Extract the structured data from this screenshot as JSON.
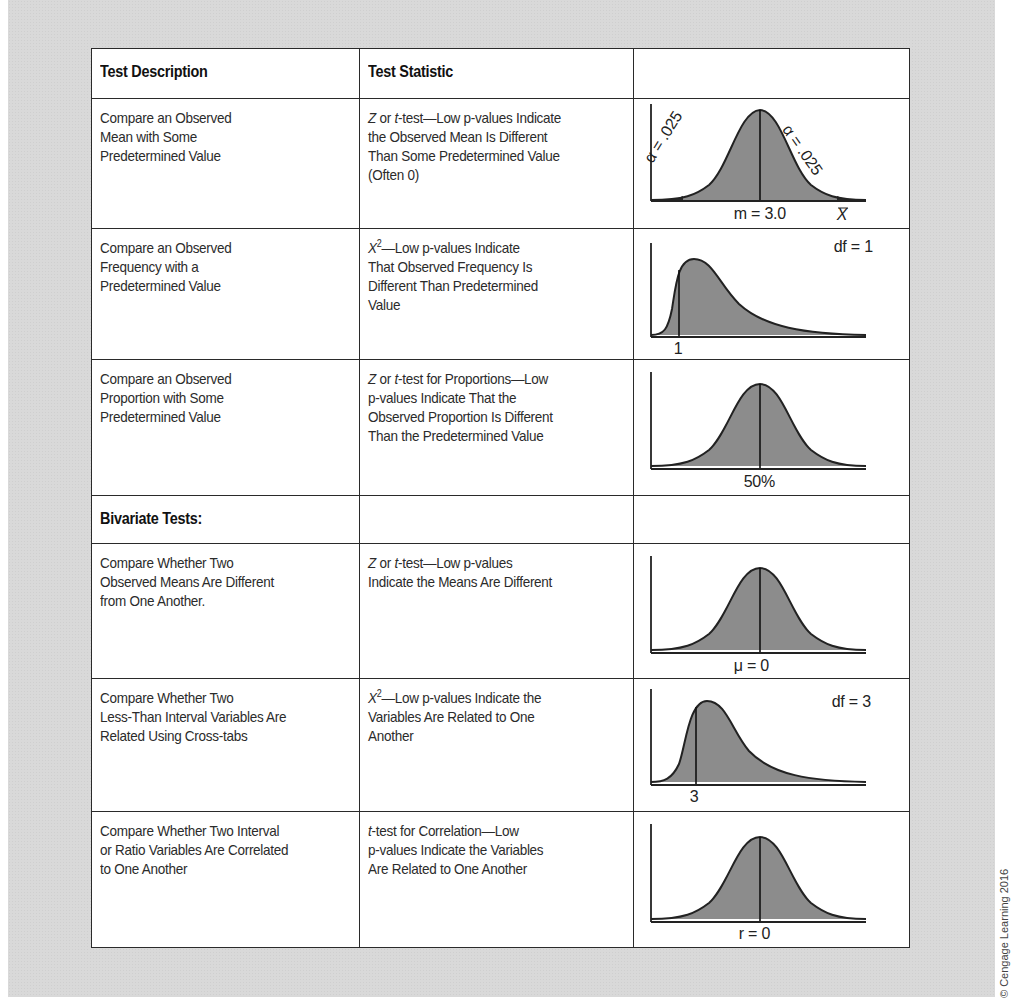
{
  "table": {
    "headers": [
      "Test Description",
      "Test Statistic",
      ""
    ],
    "rows": [
      {
        "description": [
          "Compare an Observed",
          "Mean with Some",
          "Predetermined Value"
        ],
        "statistic_prefix": "Z",
        "statistic": [
          "Z or t-test—Low p-values Indicate",
          "the Observed Mean Is Different",
          "Than Some Predetermined Value",
          "(Often 0)"
        ],
        "graph": {
          "type": "normal-two-tailed",
          "center_label": "m = 3.0",
          "axis_label": "X̄",
          "left_tail_label": "α = .025",
          "right_tail_label": "α = .025"
        }
      },
      {
        "description": [
          "Compare an Observed",
          "Frequency with a",
          "Predetermined Value"
        ],
        "statistic": [
          "X²—Low p-values Indicate",
          "That Observed Frequency Is",
          "Different Than Predetermined",
          "Value"
        ],
        "graph": {
          "type": "chi-square",
          "marker_label": "1",
          "df_label": "df = 1"
        }
      },
      {
        "description": [
          "Compare an Observed",
          "Proportion with Some",
          "Predetermined Value"
        ],
        "statistic": [
          "Z or t-test for Proportions—Low",
          "p-values Indicate That the",
          "Observed Proportion Is Different",
          "Than the Predetermined Value"
        ],
        "graph": {
          "type": "normal",
          "center_label": "50%"
        }
      },
      {
        "section_heading": "Bivariate Tests:"
      },
      {
        "description": [
          "Compare Whether Two",
          "Observed Means Are Different",
          "from One Another."
        ],
        "statistic": [
          "Z or t-test—Low p-values",
          "Indicate the Means Are Different"
        ],
        "graph": {
          "type": "normal",
          "center_label": "μ = 0"
        }
      },
      {
        "description": [
          "Compare Whether Two",
          "Less-Than Interval Variables Are",
          "Related Using Cross-tabs"
        ],
        "statistic": [
          "X²—Low p-values Indicate the",
          "Variables Are Related to One",
          "Another"
        ],
        "graph": {
          "type": "chi-square",
          "marker_label": "3",
          "df_label": "df = 3"
        }
      },
      {
        "description": [
          "Compare Whether Two Interval",
          "or Ratio Variables Are Correlated",
          "to One Another"
        ],
        "statistic": [
          "t-test for Correlation—Low",
          "p-values Indicate the Variables",
          "Are Related to One Another"
        ],
        "graph": {
          "type": "normal",
          "center_label": "r = 0"
        }
      }
    ]
  },
  "labels": {
    "r1_center": "m = 3.0",
    "r1_axis": "X",
    "r1_left_alpha": "α = .025",
    "r1_right_alpha": "α = .025",
    "r2_marker": "1",
    "r2_df": "df = 1",
    "r3_center": "50%",
    "r5_center": "μ = 0",
    "r6_marker": "3",
    "r6_df": "df = 3",
    "r7_center": "r = 0"
  },
  "copyright": "© Cengage Learning 2016",
  "colors": {
    "background_panel": "#d9d9d9",
    "curve_fill": "#8c8c8c",
    "tail_fill": "#2a2a2a",
    "border": "#2a2a2a"
  }
}
